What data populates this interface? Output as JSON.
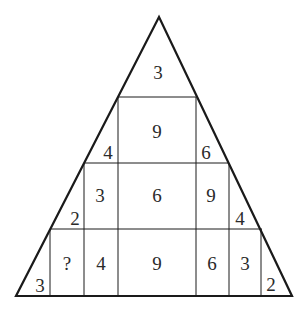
{
  "puzzle": {
    "title": "Number triangle puzzle",
    "cells": {
      "top": "3",
      "row2_center": "9",
      "row2_left_corner": "4",
      "row2_right_corner": "6",
      "row3_left": "3",
      "row3_center": "6",
      "row3_right": "9",
      "row3_left_corner": "2",
      "row3_right_corner": "4",
      "row4_q": "?",
      "row4_left": "4",
      "row4_center": "9",
      "row4_right": "6",
      "row4_far_right": "3",
      "row4_left_corner": "3",
      "row4_right_corner": "2"
    },
    "colors": {
      "line": "#1a1a1a",
      "text": "#2a2a2a",
      "background": "#ffffff"
    }
  }
}
